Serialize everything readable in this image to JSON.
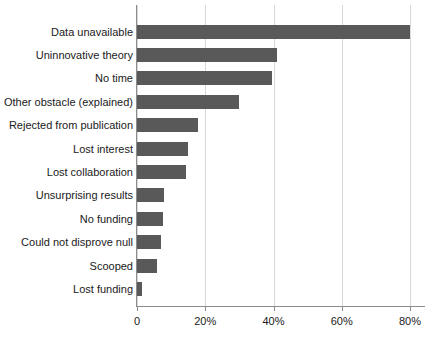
{
  "chart_data": {
    "type": "bar",
    "orientation": "horizontal",
    "title": "",
    "subtitle": "",
    "xlabel": "",
    "ylabel": "",
    "categories": [
      "Data unavailable",
      "Uninnovative theory",
      "No time",
      "Other obstacle (explained)",
      "Rejected from publication",
      "Lost interest",
      "Lost collaboration",
      "Unsurprising results",
      "No funding",
      "Could not disprove null",
      "Scooped",
      "Lost funding"
    ],
    "values": [
      80,
      41,
      39.5,
      30,
      18,
      15,
      14.5,
      8,
      7.5,
      7,
      6,
      1.5
    ],
    "xlim": [
      0,
      84.5
    ],
    "xticks": [
      0,
      20,
      40,
      60,
      80
    ],
    "xtick_labels": [
      "0",
      "20%",
      "40%",
      "60%",
      "80%"
    ],
    "grid": "vertical-light",
    "legend": "none",
    "bar_color": "#595959",
    "grid_color": "#d8d8d8",
    "axis_color": "#8c8c8c",
    "background_color": "#ffffff",
    "text_color": "#1a1a1a"
  }
}
